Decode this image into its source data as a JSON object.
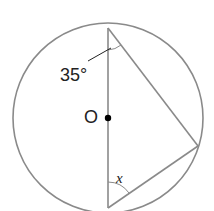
{
  "diagram": {
    "type": "circle-inscribed-triangle",
    "center_label": "O",
    "angle_top_label": "35°",
    "angle_bottom_label": "x",
    "colors": {
      "stroke": "#8a8a8a",
      "text": "#222222",
      "dot": "#000000"
    }
  }
}
